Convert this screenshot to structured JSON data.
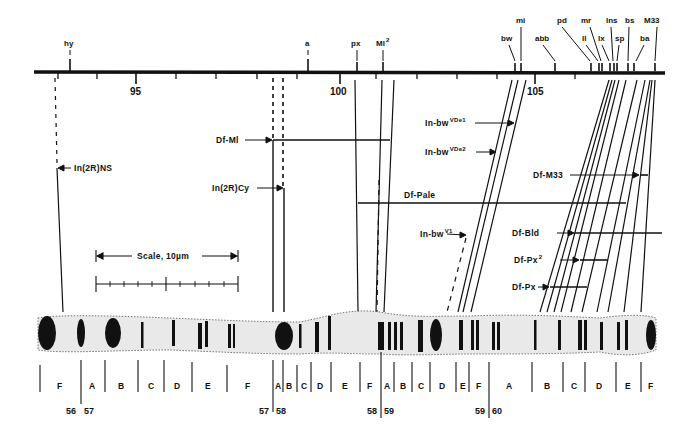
{
  "genetic_map": {
    "axis_ticks": [
      {
        "label": "95",
        "x": 136
      },
      {
        "label": "100",
        "x": 340
      },
      {
        "label": "105",
        "x": 535
      }
    ],
    "genes": [
      {
        "label": "hy",
        "x": 70,
        "y": 11
      },
      {
        "label": "a",
        "x": 308,
        "y": 11
      },
      {
        "label": "px",
        "x": 358,
        "y": 11
      },
      {
        "label": "Ml",
        "sup": "2",
        "x": 383,
        "y": 11
      },
      {
        "label": "bw",
        "x": 507,
        "y": 38
      },
      {
        "label": "mi",
        "x": 520,
        "y": 20
      },
      {
        "label": "abb",
        "x": 541,
        "y": 38
      },
      {
        "label": "pd",
        "x": 563,
        "y": 20
      },
      {
        "label": "ll",
        "x": 583,
        "y": 38
      },
      {
        "label": "mr",
        "x": 585,
        "y": 20
      },
      {
        "label": "lx",
        "x": 599,
        "y": 38
      },
      {
        "label": "lns",
        "x": 607,
        "y": 20
      },
      {
        "label": "sp",
        "x": 615,
        "y": 38
      },
      {
        "label": "bs",
        "x": 625,
        "y": 20
      },
      {
        "label": "ba",
        "x": 639,
        "y": 38
      },
      {
        "label": "M33",
        "x": 647,
        "y": 20
      }
    ]
  },
  "rearrangements": [
    {
      "label": "In(2R)NS",
      "sup": ""
    },
    {
      "label": "Df-Ml",
      "sup": ""
    },
    {
      "label": "In(2R)Cy",
      "sup": ""
    },
    {
      "label": "In-bw",
      "sup": "VDe1"
    },
    {
      "label": "In-bw",
      "sup": "VDe2"
    },
    {
      "label": "Df-M33",
      "sup": ""
    },
    {
      "label": "Df-Pale",
      "sup": ""
    },
    {
      "label": "In-bw",
      "sup": "V1"
    },
    {
      "label": "Df-Bld",
      "sup": ""
    },
    {
      "label": "Df-Px",
      "sup": "2"
    },
    {
      "label": "Df-Px",
      "sup": ""
    }
  ],
  "scale_bar": {
    "label": "Scale, 10µm"
  },
  "cytology": {
    "bands": [
      "F",
      "A",
      "B",
      "C",
      "D",
      "E",
      "F",
      "A",
      "B",
      "C",
      "D",
      "E",
      "F",
      "A",
      "B",
      "C",
      "D",
      "E",
      "F",
      "A",
      "B",
      "C",
      "D",
      "E",
      "F"
    ],
    "divisions": [
      {
        "left": "56",
        "right": "57"
      },
      {
        "left": "57",
        "right": "58"
      },
      {
        "left": "58",
        "right": "59"
      },
      {
        "left": "59",
        "right": "60"
      }
    ]
  }
}
